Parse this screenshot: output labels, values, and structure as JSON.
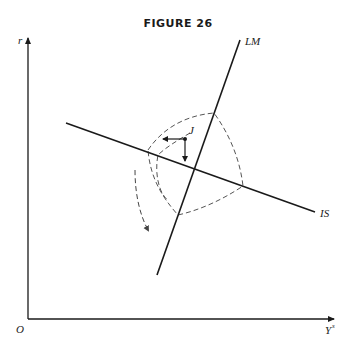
{
  "figure": {
    "title": "FIGURE 26",
    "y_axis_label": "r",
    "x_axis_label": "Y",
    "x_axis_superscript": "s",
    "origin_label": "O",
    "curves": [
      {
        "name": "LM",
        "label": "LM"
      },
      {
        "name": "IS",
        "label": "IS"
      }
    ],
    "point_label": "J",
    "colors": {
      "line": "#1a1a1a",
      "dashed": "#555555",
      "background": "#ffffff"
    }
  }
}
